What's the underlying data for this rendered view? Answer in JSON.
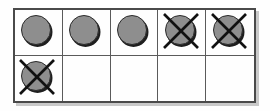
{
  "figure": {
    "name": "counter-grid-diagram",
    "columns": 5,
    "rows": 2,
    "colors": {
      "background": "#fefefe",
      "grid_border": "#4a4a4a",
      "grid_divider": "#5a5a5a",
      "shadow": "#c9c9c9",
      "disc_fill": "#8e8e8e",
      "disc_outline": "#2b2b2b",
      "cross_stroke": "#111111"
    },
    "cells": [
      {
        "row": 1,
        "col": 1,
        "state": "counter",
        "crossed": false,
        "label": "counter"
      },
      {
        "row": 1,
        "col": 2,
        "state": "counter",
        "crossed": false,
        "label": "counter"
      },
      {
        "row": 1,
        "col": 3,
        "state": "counter",
        "crossed": false,
        "label": "counter"
      },
      {
        "row": 1,
        "col": 4,
        "state": "counter",
        "crossed": true,
        "label": "counter crossed out"
      },
      {
        "row": 1,
        "col": 5,
        "state": "counter",
        "crossed": true,
        "label": "counter crossed out"
      },
      {
        "row": 2,
        "col": 1,
        "state": "counter",
        "crossed": true,
        "label": "counter crossed out"
      },
      {
        "row": 2,
        "col": 2,
        "state": "empty",
        "crossed": false,
        "label": "empty cell"
      },
      {
        "row": 2,
        "col": 3,
        "state": "empty",
        "crossed": false,
        "label": "empty cell"
      },
      {
        "row": 2,
        "col": 4,
        "state": "empty",
        "crossed": false,
        "label": "empty cell"
      },
      {
        "row": 2,
        "col": 5,
        "state": "empty",
        "crossed": false,
        "label": "empty cell"
      }
    ],
    "counts": {
      "total_cells": 10,
      "counters_total": 6,
      "counters_crossed": 3,
      "counters_remaining": 3,
      "empty_cells": 4
    }
  }
}
